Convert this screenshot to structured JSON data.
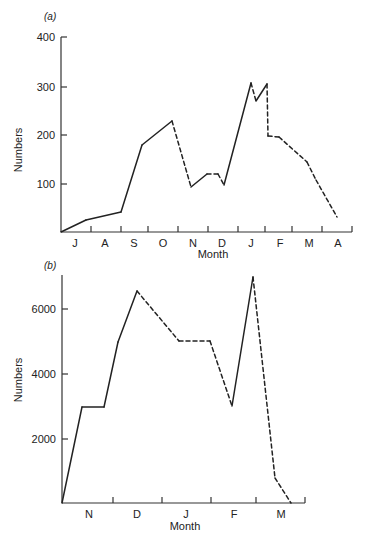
{
  "chart_data": [
    {
      "type": "line",
      "panel_label": "(a)",
      "title": "",
      "xlabel": "Month",
      "ylabel": "Numbers",
      "ylim": [
        0,
        400
      ],
      "yticks": [
        "100",
        "200",
        "300",
        "400"
      ],
      "xticks": [
        "J",
        "A",
        "S",
        "O",
        "N",
        "D",
        "J",
        "F",
        "M",
        "A"
      ],
      "grid": false,
      "legend": null,
      "note": "Solid and dashed segments alternate along a single series",
      "series": [
        {
          "name": "Numbers",
          "points": [
            {
              "x": 0.0,
              "y": 0,
              "style": "solid"
            },
            {
              "x": 0.85,
              "y": 25,
              "style": "solid"
            },
            {
              "x": 2.0,
              "y": 42,
              "style": "solid"
            },
            {
              "x": 2.7,
              "y": 178,
              "style": "solid"
            },
            {
              "x": 3.75,
              "y": 228,
              "style": "dashed"
            },
            {
              "x": 4.4,
              "y": 93,
              "style": "solid"
            },
            {
              "x": 4.95,
              "y": 119,
              "style": "dashed"
            },
            {
              "x": 5.3,
              "y": 119,
              "style": "dashed"
            },
            {
              "x": 5.5,
              "y": 97,
              "style": "solid"
            },
            {
              "x": 6.4,
              "y": 306,
              "style": "dashed"
            },
            {
              "x": 6.6,
              "y": 269,
              "style": "solid"
            },
            {
              "x": 6.95,
              "y": 304,
              "style": "dashed"
            },
            {
              "x": 7.05,
              "y": 199,
              "style": "dashed"
            },
            {
              "x": 7.35,
              "y": 195,
              "style": "dashed"
            },
            {
              "x": 8.3,
              "y": 144,
              "style": "dashed"
            },
            {
              "x": 8.6,
              "y": 107,
              "style": "dashed"
            },
            {
              "x": 9.85,
              "y": 30,
              "style": "dashed"
            }
          ]
        }
      ],
      "px": {
        "x0": 61,
        "xend": 352,
        "y0": 232,
        "ytop": 37,
        "ticks_x": [
          91,
          121,
          148,
          178,
          208,
          238,
          265,
          292,
          322,
          352
        ],
        "label_x": [
          75,
          105,
          134,
          163,
          193,
          222,
          251,
          280,
          309,
          338
        ],
        "path": [
          [
            61,
            232
          ],
          [
            86,
            220
          ],
          [
            121,
            212
          ],
          [
            142,
            145
          ],
          [
            172,
            121
          ],
          [
            191,
            187
          ],
          [
            207,
            174
          ],
          [
            218,
            174
          ],
          [
            224,
            185
          ],
          [
            251,
            83
          ],
          [
            256,
            101
          ],
          [
            267,
            84
          ],
          [
            268,
            136
          ],
          [
            279,
            137
          ],
          [
            307,
            162
          ],
          [
            316,
            180
          ],
          [
            337,
            217
          ]
        ],
        "styles": [
          "solid",
          "solid",
          "solid",
          "solid",
          "dashed",
          "solid",
          "dashed",
          "dashed",
          "solid",
          "dashed",
          "solid",
          "dashed",
          "dashed",
          "dashed",
          "dashed",
          "dashed"
        ]
      }
    },
    {
      "type": "line",
      "panel_label": "(b)",
      "title": "",
      "xlabel": "Month",
      "ylabel": "Numbers",
      "ylim": [
        0,
        7000
      ],
      "yticks": [
        "2000",
        "4000",
        "6000"
      ],
      "xticks": [
        "N",
        "D",
        "J",
        "F",
        "M"
      ],
      "grid": false,
      "legend": null,
      "note": "Solid and dashed segments alternate along a single series",
      "series": [
        {
          "name": "Numbers",
          "points": [
            {
              "x": 0.0,
              "y": 0,
              "style": "solid"
            },
            {
              "x": 0.4,
              "y": 3000,
              "style": "solid"
            },
            {
              "x": 0.85,
              "y": 3000,
              "style": "solid"
            },
            {
              "x": 1.15,
              "y": 5000,
              "style": "solid"
            },
            {
              "x": 1.55,
              "y": 6550,
              "style": "dashed"
            },
            {
              "x": 2.4,
              "y": 5000,
              "style": "dashed"
            },
            {
              "x": 3.0,
              "y": 5000,
              "style": "dashed"
            },
            {
              "x": 3.45,
              "y": 3000,
              "style": "solid"
            },
            {
              "x": 3.9,
              "y": 6950,
              "style": "dashed"
            },
            {
              "x": 4.4,
              "y": 900,
              "style": "dashed"
            },
            {
              "x": 4.7,
              "y": 0,
              "style": "dashed"
            }
          ]
        }
      ],
      "px": {
        "x0": 62,
        "xend": 305,
        "y0": 503,
        "ytop": 275,
        "ticks_x": [
          113,
          162,
          211,
          256,
          305
        ],
        "label_x": [
          89,
          137,
          186,
          234,
          281
        ],
        "path": [
          [
            62,
            503
          ],
          [
            82,
            407
          ],
          [
            104,
            407
          ],
          [
            118,
            342
          ],
          [
            137,
            291
          ],
          [
            179,
            341
          ],
          [
            210,
            341
          ],
          [
            232,
            406
          ],
          [
            253,
            277
          ],
          [
            275,
            478
          ],
          [
            291,
            503
          ]
        ],
        "styles": [
          "solid",
          "solid",
          "solid",
          "solid",
          "dashed",
          "dashed",
          "dashed",
          "solid",
          "dashed",
          "dashed"
        ]
      }
    }
  ],
  "labels": {
    "a": {
      "panel": "(a)",
      "xlabel": "Month",
      "ylabel": "Numbers",
      "yticks": [
        {
          "label": "400",
          "y": 37
        },
        {
          "label": "300",
          "y": 87
        },
        {
          "label": "200",
          "y": 135
        },
        {
          "label": "100",
          "y": 184
        }
      ]
    },
    "b": {
      "panel": "(b)",
      "xlabel": "Month",
      "ylabel": "Numbers",
      "yticks": [
        {
          "label": "6000",
          "y": 309
        },
        {
          "label": "4000",
          "y": 374
        },
        {
          "label": "2000",
          "y": 439
        }
      ]
    }
  }
}
